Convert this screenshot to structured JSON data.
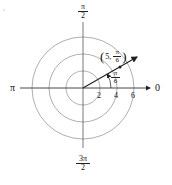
{
  "diagram": {
    "type": "polar-coordinate-plot",
    "center": {
      "x": 83,
      "y": 88
    },
    "scale_px_per_unit": 8.5,
    "circles": [
      2,
      4,
      6
    ],
    "axis_labels": {
      "right": "0",
      "left": "π",
      "top": {
        "num": "π",
        "den": "2"
      },
      "bottom": {
        "num": "3π",
        "den": "2"
      }
    },
    "tick_labels": [
      "2",
      "4",
      "6"
    ],
    "point": {
      "r": "5",
      "theta_num": "π",
      "theta_den": "6",
      "label_prefix": "(5,",
      "label_suffix": ")"
    },
    "angle_label": {
      "num": "π",
      "den": "6"
    },
    "colors": {
      "circle": "#9a9a9a",
      "axis": "#333333",
      "ray": "#222222"
    }
  }
}
